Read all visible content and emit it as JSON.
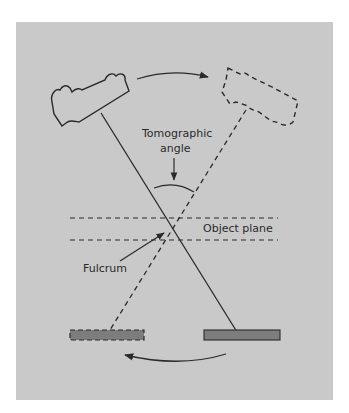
{
  "diagram": {
    "labels": {
      "tomographic_angle_line1": "Tomographic",
      "tomographic_angle_line2": "angle",
      "object_plane": "Object plane",
      "fulcrum": "Fulcrum"
    },
    "colors": {
      "background": "#c9c9c9",
      "line": "#2a2a2a",
      "film_fill": "#7d7d7d"
    },
    "elements": [
      {
        "name": "x-ray-tube-initial",
        "style": "solid"
      },
      {
        "name": "x-ray-tube-final",
        "style": "dashed"
      },
      {
        "name": "beam-initial",
        "style": "solid"
      },
      {
        "name": "beam-final",
        "style": "dashed"
      },
      {
        "name": "film-initial",
        "style": "solid"
      },
      {
        "name": "film-final",
        "style": "dashed"
      },
      {
        "name": "tube-motion-arrow",
        "direction": "right"
      },
      {
        "name": "film-motion-arrow",
        "direction": "left"
      }
    ]
  }
}
